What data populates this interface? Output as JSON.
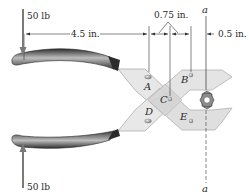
{
  "forces": {
    "top": "50 lb",
    "bottom": "50 lb"
  },
  "dimensions": {
    "handle_length": "4.5 in.",
    "pin_spacing": "0.75 in.",
    "jaw_offset": "0.5 in."
  },
  "section_label_top": "a",
  "section_label_bottom": "a",
  "points": {
    "A": "A",
    "B": "B",
    "C": "C",
    "D": "D",
    "E": "E"
  },
  "colors": {
    "handle_dark": "#3a3a3a",
    "handle_light": "#b8b8b8",
    "jaw_fill": "#e6e6e6",
    "jaw_stroke": "#a8a8a8",
    "force_arrow": "#7a7a7a"
  }
}
